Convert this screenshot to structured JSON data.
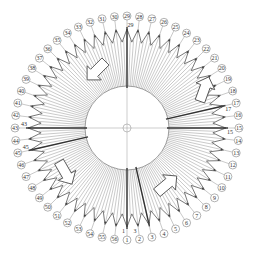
{
  "diagram": {
    "type": "circular-winding-layout",
    "center": {
      "x": 127,
      "y": 128
    },
    "label_count": 56,
    "labels": [
      "1",
      "2",
      "3",
      "4",
      "5",
      "6",
      "7",
      "8",
      "9",
      "10",
      "11",
      "12",
      "13",
      "14",
      "15",
      "16",
      "17",
      "18",
      "19",
      "20",
      "21",
      "22",
      "23",
      "24",
      "25",
      "26",
      "27",
      "28",
      "29",
      "30",
      "31",
      "32",
      "33",
      "34",
      "35",
      "36",
      "37",
      "38",
      "39",
      "40",
      "41",
      "42",
      "43",
      "44",
      "45",
      "46",
      "47",
      "48",
      "49",
      "50",
      "51",
      "52",
      "53",
      "54",
      "55",
      "56"
    ],
    "inner_tags": [
      {
        "text": "3",
        "near_label": "2"
      },
      {
        "text": "15",
        "near_label": "15"
      },
      {
        "text": "17",
        "near_label": "17"
      },
      {
        "text": "29",
        "near_label": "29"
      },
      {
        "text": "43",
        "near_label": "43"
      },
      {
        "text": "45",
        "near_label": "45"
      },
      {
        "text": "1",
        "near_label": "1"
      }
    ],
    "arrows": [
      {
        "name": "arrow-upper-left",
        "direction": "down-left"
      },
      {
        "name": "arrow-upper-right",
        "direction": "up"
      },
      {
        "name": "arrow-lower-right",
        "direction": "up-right"
      },
      {
        "name": "arrow-lower-left",
        "direction": "down-right"
      }
    ],
    "colors": {
      "line": "#555555",
      "heavy_line": "#333333",
      "label_stroke": "#666666",
      "background": "#ffffff"
    }
  }
}
